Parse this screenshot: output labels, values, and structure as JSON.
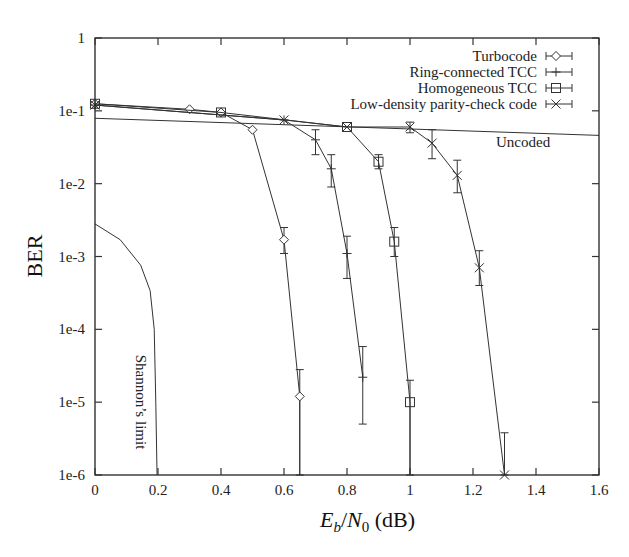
{
  "chart_data": {
    "type": "line",
    "title": "",
    "xlabel": "E_b/N_0 (dB)",
    "xlabel_parts": {
      "E": "E",
      "b": "b",
      "slash": "/",
      "N": "N",
      "zero": "0",
      "unit": " (dB)"
    },
    "ylabel": "BER",
    "xlim": [
      0,
      1.6
    ],
    "ylim": [
      1e-06,
      1
    ],
    "yscale": "log",
    "grid": false,
    "legend_position": "upper right",
    "x_ticks": [
      {
        "v": 0,
        "label": "0"
      },
      {
        "v": 0.2,
        "label": "0.2"
      },
      {
        "v": 0.4,
        "label": "0.4"
      },
      {
        "v": 0.6,
        "label": "0.6"
      },
      {
        "v": 0.8,
        "label": "0.8"
      },
      {
        "v": 1.0,
        "label": "1"
      },
      {
        "v": 1.2,
        "label": "1.2"
      },
      {
        "v": 1.4,
        "label": "1.4"
      },
      {
        "v": 1.6,
        "label": "1.6"
      }
    ],
    "y_ticks": [
      {
        "v": 1,
        "label": "1"
      },
      {
        "v": 0.1,
        "label": "1e-1"
      },
      {
        "v": 0.01,
        "label": "1e-2"
      },
      {
        "v": 0.001,
        "label": "1e-3"
      },
      {
        "v": 0.0001,
        "label": "1e-4"
      },
      {
        "v": 1e-05,
        "label": "1e-5"
      },
      {
        "v": 1e-06,
        "label": "1e-6"
      }
    ],
    "series": [
      {
        "name": "Turbocode",
        "marker": "diamond",
        "points": [
          [
            0,
            0.125
          ],
          [
            0.3,
            0.105
          ],
          [
            0.4,
            0.095
          ],
          [
            0.5,
            0.055
          ],
          [
            0.6,
            0.0017
          ],
          [
            0.65,
            1.2e-05
          ]
        ],
        "errors": [
          [
            0.6,
            0.0025,
            0.0011
          ],
          [
            0.65,
            2.8e-05,
            1e-06
          ]
        ],
        "tail": [
          [
            0.65,
            1e-06
          ]
        ]
      },
      {
        "name": "Ring-connected TCC",
        "marker": "plus",
        "points": [
          [
            0,
            0.12
          ],
          [
            0.6,
            0.075
          ],
          [
            0.7,
            0.04
          ],
          [
            0.75,
            0.016
          ],
          [
            0.8,
            0.0011
          ],
          [
            0.85,
            2.2e-05
          ]
        ],
        "errors": [
          [
            0.7,
            0.055,
            0.025
          ],
          [
            0.75,
            0.025,
            0.009
          ],
          [
            0.8,
            0.0019,
            0.0005
          ],
          [
            0.85,
            5.8e-05,
            5e-06
          ]
        ],
        "tail": []
      },
      {
        "name": "Homogeneous TCC",
        "marker": "square",
        "points": [
          [
            0,
            0.125
          ],
          [
            0.4,
            0.095
          ],
          [
            0.8,
            0.06
          ],
          [
            0.9,
            0.02
          ],
          [
            0.95,
            0.0016
          ],
          [
            1.0,
            1e-05
          ]
        ],
        "errors": [
          [
            0.9,
            0.025,
            0.016
          ],
          [
            0.95,
            0.0025,
            0.001
          ],
          [
            1.0,
            2e-05,
            1e-06
          ]
        ],
        "tail": [
          [
            1.0,
            1e-06
          ]
        ]
      },
      {
        "name": "Low-density parity-check code",
        "marker": "cross",
        "points": [
          [
            0,
            0.12
          ],
          [
            0.6,
            0.075
          ],
          [
            0.8,
            0.06
          ],
          [
            1.0,
            0.06
          ],
          [
            1.07,
            0.036
          ],
          [
            1.15,
            0.013
          ],
          [
            1.22,
            0.0007
          ],
          [
            1.3,
            1e-06
          ]
        ],
        "errors": [
          [
            1.0,
            0.07,
            0.05
          ],
          [
            1.07,
            0.055,
            0.022
          ],
          [
            1.15,
            0.021,
            0.0075
          ],
          [
            1.22,
            0.0012,
            0.0004
          ],
          [
            1.3,
            3.8e-06,
            1e-06
          ]
        ],
        "tail": []
      }
    ],
    "reference_lines": [
      {
        "name": "Uncoded",
        "points": [
          [
            0,
            0.079
          ],
          [
            1.6,
            0.046
          ]
        ],
        "label": "Uncoded",
        "label_at": [
          1.25,
          0.036
        ]
      },
      {
        "name": "Shannon's limit",
        "points": [
          [
            0,
            0.0028
          ],
          [
            0.08,
            0.0017
          ],
          [
            0.145,
            0.00076
          ],
          [
            0.175,
            0.00034
          ],
          [
            0.188,
            0.0001
          ],
          [
            0.193,
            1e-05
          ],
          [
            0.197,
            1e-06
          ]
        ],
        "label": "Shannon’s limit"
      }
    ]
  },
  "legend": {
    "items": [
      {
        "label": "Turbocode",
        "marker": "diamond"
      },
      {
        "label": "Ring-connected TCC",
        "marker": "plus"
      },
      {
        "label": "Homogeneous TCC",
        "marker": "square"
      },
      {
        "label": "Low-density parity-check code",
        "marker": "cross"
      }
    ]
  },
  "annotations": {
    "uncoded": "Uncoded",
    "shannon": "Shannon’s limit"
  }
}
